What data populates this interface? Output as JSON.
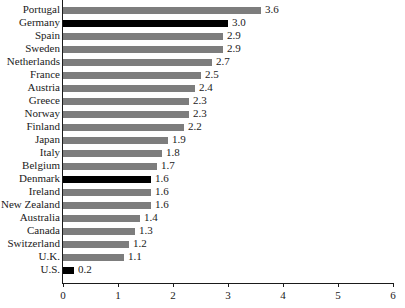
{
  "chart_data": {
    "type": "bar",
    "orientation": "horizontal",
    "title": "",
    "subtitle": "",
    "xlabel": "",
    "ylabel": "",
    "xlim": [
      0,
      6
    ],
    "xticks": [
      0,
      1,
      2,
      3,
      4,
      5,
      6
    ],
    "xtick_labels": [
      "0",
      "1",
      "2",
      "3",
      "4",
      "5",
      "6"
    ],
    "grid": false,
    "legend": null,
    "categories": [
      "Portugal",
      "Germany",
      "Spain",
      "Sweden",
      "Netherlands",
      "France",
      "Austria",
      "Greece",
      "Norway",
      "Finland",
      "Japan",
      "Italy",
      "Belgium",
      "Denmark",
      "Ireland",
      "New Zealand",
      "Australia",
      "Canada",
      "Switzerland",
      "U.K.",
      "U.S."
    ],
    "values": [
      3.6,
      3.0,
      2.9,
      2.9,
      2.7,
      2.5,
      2.4,
      2.3,
      2.3,
      2.2,
      1.9,
      1.8,
      1.7,
      1.6,
      1.6,
      1.6,
      1.4,
      1.3,
      1.2,
      1.1,
      0.2
    ],
    "value_labels": [
      "3.6",
      "3.0",
      "2.9",
      "2.9",
      "2.7",
      "2.5",
      "2.4",
      "2.3",
      "2.3",
      "2.2",
      "1.9",
      "1.8",
      "1.7",
      "1.6",
      "1.6",
      "1.6",
      "1.4",
      "1.3",
      "1.2",
      "1.1",
      "0.2"
    ],
    "highlighted": [
      "Germany",
      "Denmark",
      "U.S."
    ],
    "colors": {
      "bar": "#7d7d7d",
      "bar_highlight": "#000000",
      "axis": "#1a1a1a",
      "text": "#1a1a1a",
      "background": "#ffffff"
    }
  }
}
